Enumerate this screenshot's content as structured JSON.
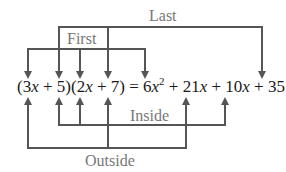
{
  "diagram": {
    "equation": {
      "lhs": "(3x + 5)(2x + 7)",
      "equals": "=",
      "rhs": "6x² + 21x + 10x + 35",
      "segments": [
        {
          "text": "(3",
          "italic": false
        },
        {
          "text": "x",
          "italic": true
        },
        {
          "text": " + 5)(2",
          "italic": false
        },
        {
          "text": "x",
          "italic": true
        },
        {
          "text": " + 7) = 6",
          "italic": false
        },
        {
          "text": "x",
          "italic": true
        },
        {
          "text": "2",
          "italic": false,
          "sup": true
        },
        {
          "text": " + 21",
          "italic": false
        },
        {
          "text": "x",
          "italic": true
        },
        {
          "text": " + 10",
          "italic": false
        },
        {
          "text": "x",
          "italic": true
        },
        {
          "text": " + 35",
          "italic": false
        }
      ]
    },
    "labels": {
      "last": "Last",
      "first": "First",
      "inside": "Inside",
      "outside": "Outside"
    },
    "connections": [
      {
        "name": "First",
        "from": [
          "3x",
          "2x"
        ],
        "to": "6x²"
      },
      {
        "name": "Last",
        "from": [
          "5",
          "7"
        ],
        "to": "35"
      },
      {
        "name": "Inside",
        "from": [
          "5",
          "2x"
        ],
        "to": "10x"
      },
      {
        "name": "Outside",
        "from": [
          "3x",
          "7"
        ],
        "to": "21x"
      }
    ],
    "colors": {
      "line": "#555555",
      "label": "#777777",
      "equation": "#1a1a1a"
    }
  }
}
